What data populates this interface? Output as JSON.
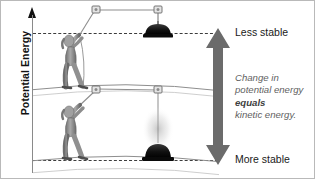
{
  "figure": {
    "axis": {
      "label": "Potential Energy",
      "arrow_icon": "up-arrow-icon"
    },
    "levels": {
      "top": {
        "label": "Less stable",
        "line_style": "dashed"
      },
      "bottom": {
        "label": "More stable",
        "line_style": "dashed"
      }
    },
    "energy_arrow": {
      "icon": "double-headed-vertical-arrow-icon",
      "color": "#6b6b6b",
      "direction": "both"
    },
    "caption": {
      "line1": "Change in",
      "line2": "potential energy",
      "emphasis": "equals",
      "line4": "kinetic energy.",
      "color": "#5f5f5f"
    },
    "scenes": {
      "upper": {
        "name": "person-raising-weight-scene",
        "description": "Person pulling a rope through two pulleys lifting a dark weight to the high position",
        "weight_state": "raised",
        "weight_color": "#111111"
      },
      "lower": {
        "name": "weight-falling-to-ground-scene",
        "description": "Same person with the weight fallen to the ground showing a motion blur trail",
        "weight_state": "lowered",
        "weight_color": "#111111"
      }
    }
  }
}
